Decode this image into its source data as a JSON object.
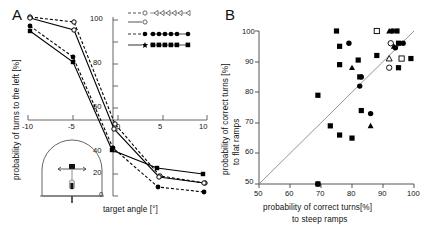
{
  "figure": {
    "panels": [
      {
        "letter": "A",
        "xlabel": "target angle [°]",
        "ylabel": "probability of turns to the left [%]",
        "xticks": [
          "-10",
          "-5",
          "0",
          "5",
          "10"
        ],
        "yticks": [
          "0",
          "20",
          "40",
          "60",
          "80",
          "100"
        ],
        "inset_name": "arena-schematic"
      },
      {
        "letter": "B",
        "xlabel_line1": "probability of correct turns[%]",
        "xlabel_line2": "to steep ramps",
        "ylabel_line1": "probability of correct turns [%]",
        "ylabel_line2": "to flat ramps",
        "xticks": [
          "50",
          "60",
          "70",
          "80",
          "90",
          "100"
        ],
        "yticks": [
          "50",
          "60",
          "70",
          "80",
          "90",
          "100"
        ]
      }
    ]
  },
  "legend": {
    "entries": [
      {
        "marker": "open-circle",
        "line": "dashed",
        "trail": "open-triangle-left"
      },
      {
        "marker": "open-circle",
        "line": "solid",
        "trail": "none"
      },
      {
        "marker": "filled-circle",
        "line": "dashed",
        "trail": "filled-circle"
      },
      {
        "marker": "filled-star",
        "line": "solid",
        "trail": "filled-square"
      }
    ]
  },
  "chart_data": [
    {
      "type": "line",
      "title": "",
      "xlabel": "target angle [°]",
      "ylabel": "probability of turns to the left [%]",
      "xlim": [
        -12,
        11
      ],
      "ylim": [
        0,
        100
      ],
      "xticks": [
        -10,
        -5,
        0,
        5,
        10
      ],
      "yticks": [
        0,
        20,
        40,
        60,
        80,
        100
      ],
      "grid": false,
      "legend_position": "top-right",
      "x": [
        -10,
        -5,
        0,
        5,
        10
      ],
      "series": [
        {
          "name": "open-circle-dashed",
          "style": "dashed",
          "marker": "open-circle",
          "values": [
            100,
            96,
            62,
            18,
            12
          ]
        },
        {
          "name": "open-circle-solid",
          "style": "solid",
          "marker": "open-circle",
          "values": [
            99,
            89,
            55,
            17,
            12
          ]
        },
        {
          "name": "filled-circle-dashed",
          "style": "dashed",
          "marker": "filled-circle",
          "values": [
            93,
            75,
            40,
            10,
            5
          ]
        },
        {
          "name": "filled-star-solid",
          "style": "solid",
          "marker": "filled-star",
          "values": [
            89,
            72,
            38,
            22,
            18
          ]
        }
      ]
    },
    {
      "type": "scatter",
      "title": "",
      "xlabel": "probability of correct turns[%] to steep ramps",
      "ylabel": "probability of correct turns [%] to flat ramps",
      "xlim": [
        50,
        100
      ],
      "ylim": [
        50,
        100
      ],
      "xticks": [
        50,
        60,
        70,
        80,
        90,
        100
      ],
      "yticks": [
        50,
        60,
        70,
        80,
        90,
        100
      ],
      "grid": false,
      "identity_line": true,
      "points": [
        {
          "x": 69,
          "y": 50,
          "marker": "filled-square"
        },
        {
          "x": 69,
          "y": 50,
          "marker": "filled-circle"
        },
        {
          "x": 69,
          "y": 79,
          "marker": "filled-square"
        },
        {
          "x": 73,
          "y": 69,
          "marker": "filled-square"
        },
        {
          "x": 76,
          "y": 66,
          "marker": "filled-square"
        },
        {
          "x": 80,
          "y": 65,
          "marker": "filled-square"
        },
        {
          "x": 83,
          "y": 74,
          "marker": "filled-square"
        },
        {
          "x": 86,
          "y": 73,
          "marker": "filled-circle"
        },
        {
          "x": 86,
          "y": 69,
          "marker": "filled-triangle"
        },
        {
          "x": 75,
          "y": 100,
          "marker": "filled-square"
        },
        {
          "x": 76,
          "y": 95,
          "marker": "filled-square"
        },
        {
          "x": 79,
          "y": 96,
          "marker": "filled-circle"
        },
        {
          "x": 76,
          "y": 89,
          "marker": "filled-square"
        },
        {
          "x": 80,
          "y": 88,
          "marker": "filled-triangle"
        },
        {
          "x": 82,
          "y": 90.5,
          "marker": "filled-square"
        },
        {
          "x": 82.5,
          "y": 85,
          "marker": "filled-square"
        },
        {
          "x": 83,
          "y": 85,
          "marker": "filled-circle"
        },
        {
          "x": 82.5,
          "y": 82,
          "marker": "filled-circle"
        },
        {
          "x": 88,
          "y": 100,
          "marker": "open-square"
        },
        {
          "x": 92,
          "y": 100,
          "marker": "filled-triangle"
        },
        {
          "x": 93,
          "y": 100,
          "marker": "filled-circle"
        },
        {
          "x": 94.5,
          "y": 100,
          "marker": "filled-square"
        },
        {
          "x": 92.5,
          "y": 96,
          "marker": "open-circle"
        },
        {
          "x": 93.5,
          "y": 95,
          "marker": "filled-triangle"
        },
        {
          "x": 94,
          "y": 94.5,
          "marker": "filled-circle"
        },
        {
          "x": 95,
          "y": 96,
          "marker": "filled-square"
        },
        {
          "x": 96.5,
          "y": 96,
          "marker": "filled-circle"
        },
        {
          "x": 88,
          "y": 92,
          "marker": "filled-square"
        },
        {
          "x": 92,
          "y": 91,
          "marker": "open-triangle"
        },
        {
          "x": 96,
          "y": 91,
          "marker": "open-square"
        },
        {
          "x": 99,
          "y": 91,
          "marker": "filled-square"
        },
        {
          "x": 92,
          "y": 88,
          "marker": "open-circle"
        },
        {
          "x": 95,
          "y": 88,
          "marker": "filled-square"
        }
      ]
    }
  ]
}
